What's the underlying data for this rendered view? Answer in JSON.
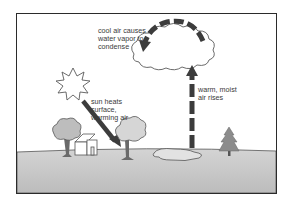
{
  "diagram": {
    "labels": {
      "cool_air": "cool air causes\nwater vapor to\ncondense",
      "sun_heats": "sun heats\nsurface,\nwarming air",
      "warm_air": "warm, moist\nair rises"
    },
    "elements": [
      "sun-icon",
      "cloud-icon",
      "tree-icon",
      "house-icon",
      "pond-icon",
      "pine-tree-icon",
      "ground",
      "sun-ray-arrow",
      "rising-air-arrow",
      "curved-cooling-arrow"
    ],
    "colors": {
      "ground": "#c9c9c9",
      "arrow": "#3c3c3c",
      "outline": "#555555",
      "foliage": "#bdbdbd",
      "pine": "#8c8c8c"
    }
  }
}
